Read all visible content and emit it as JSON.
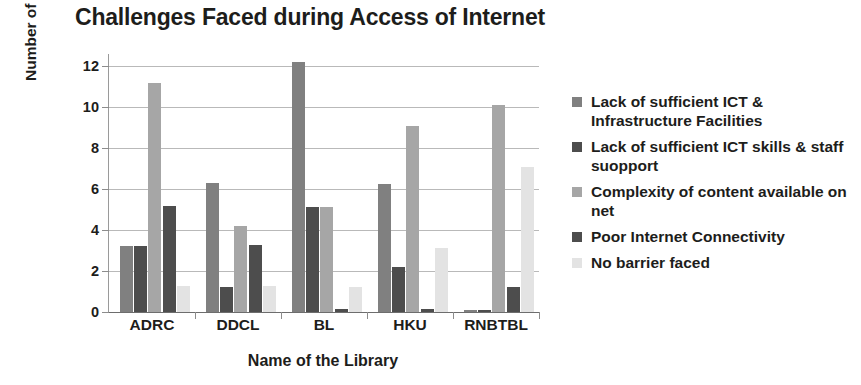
{
  "chart_data": {
    "type": "bar",
    "title": "Challenges Faced during Access of Internet",
    "xlabel": "Name of the Library",
    "ylabel": "Number of Respondents",
    "categories": [
      "ADRC",
      "DDCL",
      "BL",
      "HKU",
      "RNBTBL"
    ],
    "ylim": [
      0,
      12.6
    ],
    "yticks": [
      0,
      2,
      4,
      6,
      8,
      10,
      12
    ],
    "ytick_labels": [
      "0",
      "2",
      "4",
      "6",
      "8",
      "10",
      "12"
    ],
    "grid": true,
    "legend_position": "right",
    "series": [
      {
        "name": "Lack of sufficient ICT & Infrastructure Facilities",
        "color": "#808080",
        "values": [
          3.2,
          6.3,
          12.2,
          6.25,
          0.1
        ]
      },
      {
        "name": "Lack of sufficient ICT skills & staff suopport",
        "color": "#4d4d4d",
        "values": [
          3.2,
          1.2,
          5.15,
          2.2,
          0.1
        ]
      },
      {
        "name": "Complexity of content available on net",
        "color": "#a6a6a6",
        "values": [
          11.2,
          4.2,
          5.15,
          9.1,
          10.1
        ]
      },
      {
        "name": "Poor Internet Connectivity",
        "color": "#4d4d4d",
        "values": [
          5.2,
          3.25,
          0.15,
          0.15,
          1.2
        ]
      },
      {
        "name": "No barrier faced",
        "color": "#e3e3e3",
        "values": [
          1.25,
          1.25,
          1.2,
          3.15,
          7.1
        ]
      }
    ]
  },
  "legend": {
    "items": [
      {
        "label": "Lack of sufficient ICT & Infrastructure Facilities",
        "color": "#808080"
      },
      {
        "label": "Lack of sufficient ICT skills & staff suopport",
        "color": "#4d4d4d"
      },
      {
        "label": "Complexity of content available on net",
        "color": "#a6a6a6"
      },
      {
        "label": "Poor Internet Connectivity",
        "color": "#4d4d4d"
      },
      {
        "label": "No barrier faced",
        "color": "#e3e3e3"
      }
    ]
  }
}
